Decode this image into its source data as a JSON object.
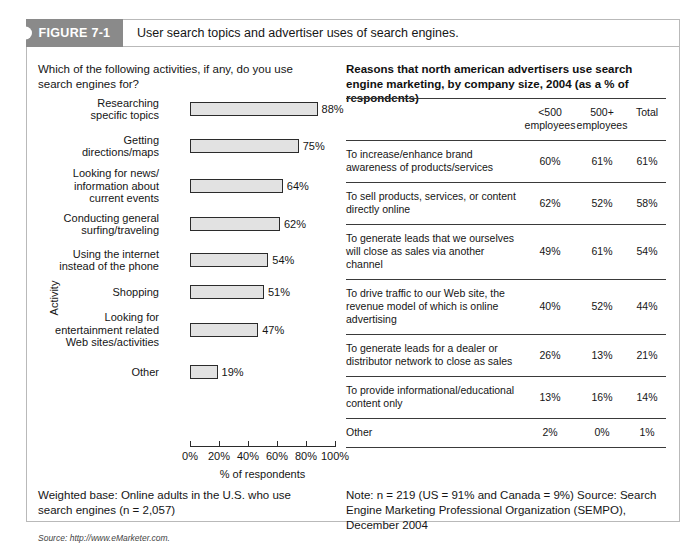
{
  "figure": {
    "badge_label": "FIGURE 7-1",
    "caption": "User search topics and advertiser uses of search engines."
  },
  "left_panel": {
    "question": "Which of the following activities, if any, do you use search engines for?",
    "note": "Weighted base: Online adults in the U.S. who use search engines (n = 2,057)",
    "source": "Source: http://www.eMarketer.com."
  },
  "right_panel": {
    "title": "Reasons that north american advertisers use search engine marketing, by company size, 2004 (as a % of respondents)",
    "columns": [
      "",
      "<500\nemployees",
      "500+\nemployees",
      "Total"
    ],
    "columns_display": {
      "reason": "",
      "small": "<500 employees",
      "small_line1": "<500",
      "small_line2": "employees",
      "large_line1": "500+",
      "large_line2": "employees",
      "total": "Total"
    },
    "rows": [
      {
        "reason": "To increase/enhance brand awareness of products/services",
        "small": "60%",
        "large": "61%",
        "total": "61%"
      },
      {
        "reason": "To sell products, services, or content directly online",
        "small": "62%",
        "large": "52%",
        "total": "58%"
      },
      {
        "reason": "To generate leads that we ourselves will close as sales via another channel",
        "small": "49%",
        "large": "61%",
        "total": "54%"
      },
      {
        "reason": "To drive traffic to our Web site, the revenue model of which is online advertising",
        "small": "40%",
        "large": "52%",
        "total": "44%"
      },
      {
        "reason": "To generate leads for a dealer or distributor network to close as sales",
        "small": "26%",
        "large": "13%",
        "total": "21%"
      },
      {
        "reason": "To provide informational/educational content only",
        "small": "13%",
        "large": "16%",
        "total": "14%"
      },
      {
        "reason": "Other",
        "small": "2%",
        "large": "0%",
        "total": "1%"
      }
    ],
    "note": "Note: n = 219 (US = 91% and Canada = 9%)\nSource: Search Engine Marketing Professional Organization (SEMPO), December 2004"
  },
  "chart_data": {
    "type": "bar",
    "orientation": "horizontal",
    "title": "Which of the following activities, if any, do you use search engines for?",
    "xlabel": "% of respondents",
    "ylabel": "Activity",
    "xlim": [
      0,
      100
    ],
    "xticks": [
      0,
      20,
      40,
      60,
      80,
      100
    ],
    "xtick_labels": [
      "0%",
      "20%",
      "40%",
      "60%",
      "80%",
      "100%"
    ],
    "grid": false,
    "legend": "none",
    "bar_fill_color": "#e2e2e2",
    "bar_border_color": "#2b2b2b",
    "categories": [
      "Researching specific topics",
      "Getting directions/maps",
      "Looking for news/ information about current events",
      "Conducting general surfing/traveling",
      "Using the internet instead of the phone",
      "Shopping",
      "Looking for entertainment related Web sites/activities",
      "Other"
    ],
    "category_labels_wrapped": [
      "Researching\nspecific topics",
      "Getting\ndirections/maps",
      "Looking for news/\ninformation about\ncurrent events",
      "Conducting general\nsurfing/traveling",
      "Using the internet\ninstead of the phone",
      "Shopping",
      "Looking for\nentertainment related\nWeb sites/activities",
      "Other"
    ],
    "values": [
      88,
      75,
      64,
      62,
      54,
      51,
      47,
      19
    ],
    "value_labels": [
      "88%",
      "75%",
      "64%",
      "62%",
      "54%",
      "51%",
      "47%",
      "19%"
    ]
  }
}
